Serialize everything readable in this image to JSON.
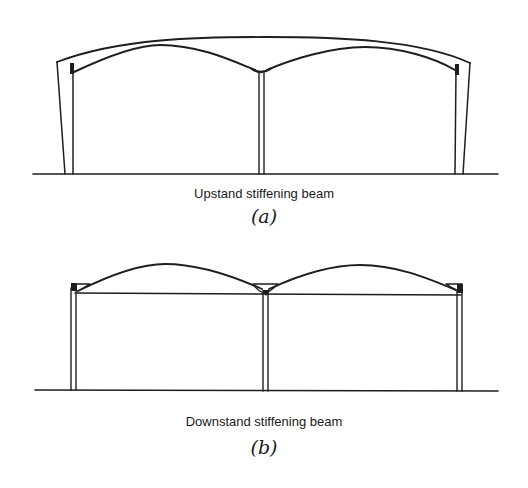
{
  "figure_a": {
    "caption": "Upstand stiffening beam",
    "label": "(a)"
  },
  "figure_b": {
    "caption": "Downstand stiffening beam",
    "label": "(b)"
  },
  "colors": {
    "line": "#1e1e1e",
    "background": "#ffffff"
  }
}
